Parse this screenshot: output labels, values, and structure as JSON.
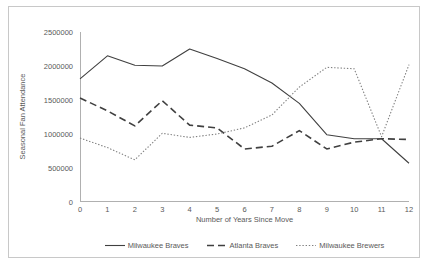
{
  "chart_data": {
    "type": "line",
    "title": "",
    "xlabel": "Number of Years Since Move",
    "ylabel": "Seasonal Fan Attendance",
    "x": [
      0,
      1,
      2,
      3,
      4,
      5,
      6,
      7,
      8,
      9,
      10,
      11,
      12
    ],
    "xlim": [
      0,
      12
    ],
    "ylim": [
      0,
      2500000
    ],
    "ytick_labels": [
      "2500000",
      "2000000",
      "1500000",
      "1000000",
      "500000",
      "0"
    ],
    "ytick_values": [
      2500000,
      2000000,
      1500000,
      1000000,
      500000,
      0
    ],
    "xtick_labels": [
      "0",
      "1",
      "2",
      "3",
      "4",
      "5",
      "6",
      "7",
      "8",
      "9",
      "10",
      "11",
      "12"
    ],
    "grid": false,
    "legend_position": "bottom",
    "series": [
      {
        "name": "Milwaukee Braves",
        "style": "solid",
        "color": "#404040",
        "values": [
          1810000,
          2150000,
          2010000,
          2000000,
          2250000,
          2110000,
          1960000,
          1750000,
          1450000,
          990000,
          930000,
          930000,
          570000
        ]
      },
      {
        "name": "Atlanta Braves",
        "style": "dashed",
        "color": "#404040",
        "values": [
          1530000,
          1340000,
          1120000,
          1490000,
          1130000,
          1090000,
          780000,
          820000,
          1050000,
          780000,
          880000,
          930000,
          920000
        ]
      },
      {
        "name": "Milwaukee Brewers",
        "style": "dotted",
        "color": "#808080",
        "values": [
          940000,
          800000,
          620000,
          1010000,
          950000,
          1000000,
          1090000,
          1280000,
          1690000,
          1980000,
          1960000,
          960000,
          2020000
        ]
      }
    ]
  }
}
